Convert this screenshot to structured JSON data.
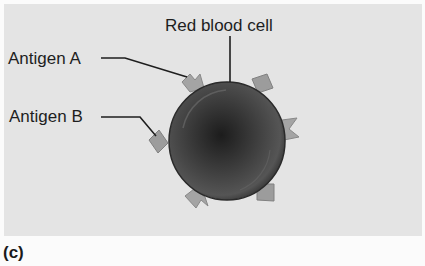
{
  "figure": {
    "panel_label": "(c)",
    "labels": {
      "red_blood_cell": "Red blood cell",
      "antigen_a": "Antigen A",
      "antigen_b": "Antigen B"
    },
    "colors": {
      "background": "#e4e4e4",
      "cell_rim": "#3a3a3a",
      "cell_center": "#1c1c1c",
      "antigen_fill": "#9a9a9a",
      "leader_line": "#1e1e1e"
    }
  }
}
